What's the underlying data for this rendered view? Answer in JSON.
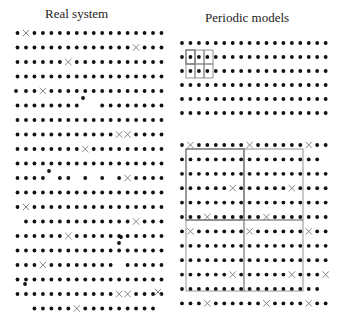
{
  "titles": {
    "left": "Real system",
    "right": "Periodic models"
  },
  "colors": {
    "atom": "#111111",
    "vacancy_cross": "#777777",
    "box_dark": "#555555",
    "box_light": "#888888"
  },
  "legend_semantics": {
    "dot": "atom",
    "cross": "vacancy / defect"
  },
  "left_panel": {
    "x0": 17.5,
    "dx": 8.47,
    "cols": 18,
    "y0": 33,
    "dy": 14.5,
    "rows": 20,
    "crosses": [
      [
        0,
        1
      ],
      [
        1,
        14
      ],
      [
        2,
        6
      ],
      [
        4,
        3
      ],
      [
        7,
        12
      ],
      [
        7,
        13
      ],
      [
        8,
        8
      ],
      [
        10,
        13
      ],
      [
        12,
        1
      ],
      [
        13,
        14
      ],
      [
        14,
        6
      ],
      [
        16,
        3
      ],
      [
        18,
        12
      ],
      [
        18,
        13
      ],
      [
        19,
        7
      ]
    ],
    "missing": [
      [
        4,
        0
      ],
      [
        5,
        8
      ],
      [
        5,
        9
      ],
      [
        10,
        4
      ],
      [
        10,
        7
      ],
      [
        10,
        9
      ],
      [
        10,
        11
      ],
      [
        10,
        13
      ],
      [
        13,
        0
      ],
      [
        16,
        12
      ],
      [
        19,
        0
      ],
      [
        19,
        1
      ],
      [
        19,
        17
      ]
    ],
    "extras": [
      [
        16,
        91
      ],
      [
        83,
        98
      ],
      [
        49,
        171
      ],
      [
        121,
        237
      ],
      [
        119,
        243
      ],
      [
        25,
        284
      ]
    ],
    "shifted_crosses": [
      [
        158,
        292
      ]
    ]
  },
  "right_top_panel": {
    "x0": 182,
    "dx": 8.45,
    "cols": 18,
    "y0": 43,
    "dy": 14,
    "rows": 6,
    "cells": [
      {
        "x": 186,
        "y": 50,
        "w": 9,
        "h": 14,
        "dark": true
      },
      {
        "x": 195,
        "y": 50,
        "w": 9,
        "h": 14,
        "dark": false
      },
      {
        "x": 204,
        "y": 50,
        "w": 9,
        "h": 14,
        "dark": false
      },
      {
        "x": 186,
        "y": 64,
        "w": 9,
        "h": 14,
        "dark": false
      },
      {
        "x": 195,
        "y": 64,
        "w": 9,
        "h": 14,
        "dark": false
      },
      {
        "x": 204,
        "y": 64,
        "w": 9,
        "h": 14,
        "dark": false
      }
    ]
  },
  "right_bottom_panel": {
    "x0": 182,
    "dx": 8.45,
    "cols": 18,
    "y0": 145,
    "dy": 14.4,
    "rows": 12,
    "crosses": [
      [
        0,
        1
      ],
      [
        0,
        8
      ],
      [
        0,
        15
      ],
      [
        3,
        6
      ],
      [
        3,
        13
      ],
      [
        5,
        3
      ],
      [
        5,
        10
      ],
      [
        6,
        1
      ],
      [
        6,
        8
      ],
      [
        6,
        15
      ],
      [
        9,
        6
      ],
      [
        9,
        13
      ],
      [
        9,
        17
      ],
      [
        11,
        3
      ],
      [
        11,
        10
      ],
      [
        11,
        15
      ]
    ],
    "missing": [
      [
        1,
        17
      ],
      [
        10,
        17
      ]
    ],
    "boxes": [
      {
        "x": 186,
        "y": 149,
        "w": 58,
        "h": 71,
        "dark": true
      },
      {
        "x": 244,
        "y": 149,
        "w": 59,
        "h": 71,
        "dark": false
      },
      {
        "x": 186,
        "y": 220,
        "w": 58,
        "h": 71,
        "dark": false
      },
      {
        "x": 244,
        "y": 220,
        "w": 59,
        "h": 71,
        "dark": false
      }
    ]
  }
}
